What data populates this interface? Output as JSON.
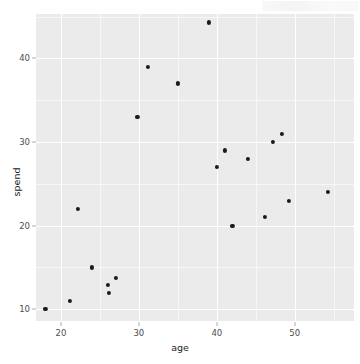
{
  "chart_data": {
    "type": "scatter",
    "title": "",
    "xlabel": "age",
    "ylabel": "spend",
    "xlim": [
      16.8,
      57.6
    ],
    "ylim": [
      8.6,
      45.3
    ],
    "xticks": [
      20,
      30,
      40,
      50
    ],
    "yticks": [
      10,
      20,
      30,
      40
    ],
    "xtick_labels": [
      "20",
      "30",
      "40",
      "50"
    ],
    "ytick_labels": [
      "10",
      "20",
      "30",
      "40"
    ],
    "grid": true,
    "grid_major_color": "#ffffff",
    "grid_minor_color": "#ffffff",
    "panel_background": "#ebebeb",
    "point_color": "#1a1a1a",
    "legend": null,
    "n_points": 20,
    "x": [
      18.0,
      21.2,
      22.2,
      24.0,
      26.0,
      26.2,
      27.0,
      29.8,
      31.2,
      35.0,
      39.0,
      40.0,
      41.0,
      42.0,
      44.0,
      46.2,
      47.2,
      48.3,
      49.2,
      54.2
    ],
    "y": [
      10.0,
      11.0,
      22.0,
      15.0,
      12.9,
      12.0,
      13.8,
      33.0,
      39.0,
      37.0,
      44.3,
      27.0,
      29.0,
      20.0,
      28.0,
      21.0,
      30.0,
      31.0,
      23.0,
      24.0
    ],
    "points": [
      {
        "x": 18.0,
        "y": 10.0
      },
      {
        "x": 21.2,
        "y": 11.0
      },
      {
        "x": 22.2,
        "y": 22.0
      },
      {
        "x": 24.0,
        "y": 15.0
      },
      {
        "x": 26.0,
        "y": 12.9
      },
      {
        "x": 26.2,
        "y": 12.0
      },
      {
        "x": 27.0,
        "y": 13.8
      },
      {
        "x": 29.8,
        "y": 33.0
      },
      {
        "x": 31.2,
        "y": 39.0
      },
      {
        "x": 35.0,
        "y": 37.0
      },
      {
        "x": 39.0,
        "y": 44.3
      },
      {
        "x": 40.0,
        "y": 27.0
      },
      {
        "x": 41.0,
        "y": 29.0
      },
      {
        "x": 42.0,
        "y": 20.0
      },
      {
        "x": 44.0,
        "y": 28.0
      },
      {
        "x": 46.2,
        "y": 21.0
      },
      {
        "x": 47.2,
        "y": 30.0
      },
      {
        "x": 48.3,
        "y": 31.0
      },
      {
        "x": 49.2,
        "y": 23.0
      },
      {
        "x": 54.2,
        "y": 24.0
      }
    ]
  }
}
